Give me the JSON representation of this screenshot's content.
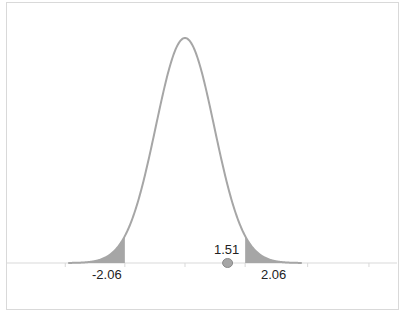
{
  "chart_data": {
    "type": "area",
    "title": "",
    "subtitle": "",
    "xlabel": "",
    "ylabel": "",
    "distribution": {
      "name": "standard normal",
      "mean": 0,
      "sd": 1
    },
    "x_range": [
      -4,
      4
    ],
    "grid": false,
    "legend": null,
    "critical_values": [
      -2.06,
      2.06
    ],
    "shaded_regions": [
      {
        "from": -4,
        "to": -2.06,
        "label": "left rejection region"
      },
      {
        "from": 2.06,
        "to": 4,
        "label": "right rejection region"
      }
    ],
    "test_statistic": {
      "value": 1.51,
      "marker": "circle"
    },
    "annotations": [
      {
        "text": "-2.06",
        "x": -2.06
      },
      {
        "text": "2.06",
        "x": 2.06
      },
      {
        "text": "1.51",
        "x": 1.51
      }
    ],
    "colors": {
      "curve": "#a6a6a6",
      "shade": "#a6a6a6",
      "axis": "#d9d9d9",
      "marker": "#a6a6a6"
    }
  },
  "labels": {
    "left_critical": "-2.06",
    "right_critical": "2.06",
    "test_stat": "1.51"
  }
}
